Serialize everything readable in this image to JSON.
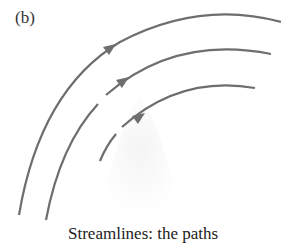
{
  "figure": {
    "panel_label": "(b)",
    "caption": "Streamlines: the paths",
    "streamline_color": "#6e6e6e",
    "streamlines": [
      {
        "name": "outer",
        "gapped": false
      },
      {
        "name": "middle",
        "gapped": true
      },
      {
        "name": "inner",
        "gapped": true
      }
    ]
  }
}
